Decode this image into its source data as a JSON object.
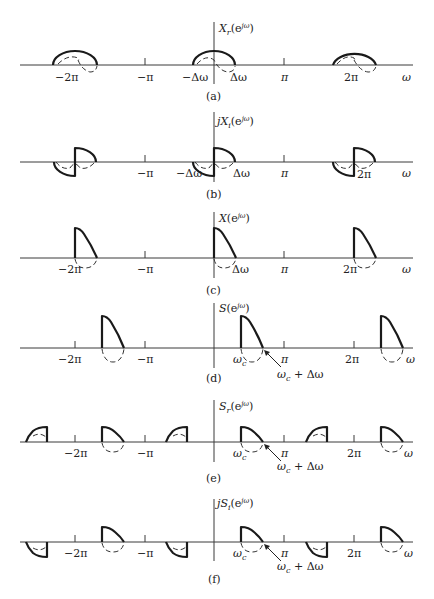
{
  "figure": {
    "axis_x": 214,
    "pi_px": 70,
    "x_left": 20,
    "x_right": 413,
    "panels": [
      {
        "id": "a",
        "caption": "(a)",
        "title": "X_r(e^{jω})",
        "title_main": "X",
        "title_sub": "r",
        "title_prefix": "",
        "axis_y": 65,
        "tick_labels": [
          "−2π",
          "−π",
          "−Δω",
          "Δω",
          "π",
          "2π",
          "ω"
        ],
        "description": "Real part: even semicircular lobes centered at 0, ±2π, width ±Δω"
      },
      {
        "id": "b",
        "caption": "(b)",
        "title": "jX_i(e^{jω})",
        "title_main": "X",
        "title_sub": "i",
        "title_prefix": "j",
        "axis_y": 162,
        "tick_labels": [
          "−π",
          "−Δω",
          "Δω",
          "π",
          "2π",
          "ω"
        ],
        "description": "Imaginary part: odd quarter-lobes, positive right of center, negative left"
      },
      {
        "id": "c",
        "caption": "(c)",
        "title": "X(e^{jω})",
        "title_main": "X",
        "title_sub": "",
        "title_prefix": "",
        "axis_y": 258,
        "tick_labels": [
          "−2π",
          "−π",
          "Δω",
          "π",
          "2π",
          "ω"
        ],
        "description": "One-sided spectrum: lobe only on 0 to Δω, repeated every 2π"
      },
      {
        "id": "d",
        "caption": "(d)",
        "title": "S(e^{jω})",
        "title_main": "S",
        "title_sub": "",
        "title_prefix": "",
        "axis_y": 348,
        "tick_labels": [
          "−2π",
          "−π",
          "ω_c",
          "π",
          "2π",
          "ω"
        ],
        "annotation": "ω_c + Δω",
        "description": "Spectrum shifted to ω_c"
      },
      {
        "id": "e",
        "caption": "(e)",
        "title": "S_r(e^{jω})",
        "title_main": "S",
        "title_sub": "r",
        "title_prefix": "",
        "axis_y": 442,
        "tick_labels": [
          "−2π",
          "−π",
          "ω_c",
          "π",
          "2π",
          "ω"
        ],
        "annotation": "ω_c + Δω",
        "description": "Real part of shifted signal: mirrored lobes"
      },
      {
        "id": "f",
        "caption": "(f)",
        "title": "jS_i(e^{jω})",
        "title_main": "S",
        "title_sub": "i",
        "title_prefix": "j",
        "axis_y": 542,
        "tick_labels": [
          "−2π",
          "−π",
          "ω_c",
          "π",
          "2π",
          "ω"
        ],
        "annotation": "ω_c + Δω",
        "description": "Imaginary part of shifted signal: negative lobes at negative-frequency images"
      }
    ],
    "labels": {
      "neg2pi": "−2π",
      "negpi": "−π",
      "pi": "π",
      "twopi": "2π",
      "omega": "ω",
      "neg_dw": "−Δω",
      "dw": "Δω",
      "wc_main": "ω",
      "wc_sub": "c",
      "wc_plus_dw": " + Δω",
      "sup": "jω",
      "open": "(e",
      "close": ")"
    }
  }
}
